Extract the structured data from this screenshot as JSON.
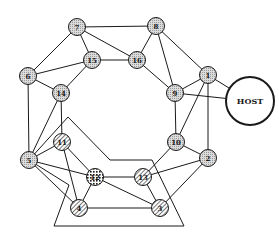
{
  "diagram": {
    "title": "",
    "host": {
      "id": "HOST",
      "label": "HOST",
      "x": 250,
      "y": 101,
      "r": 24
    },
    "nodes": [
      {
        "id": "1",
        "label": "1",
        "x": 208,
        "y": 75,
        "style": "dotted"
      },
      {
        "id": "2",
        "label": "2",
        "x": 208,
        "y": 158,
        "style": "dotted"
      },
      {
        "id": "3",
        "label": "3",
        "x": 160,
        "y": 208,
        "style": "hatched"
      },
      {
        "id": "4",
        "label": "4",
        "x": 79,
        "y": 208,
        "style": "hatched"
      },
      {
        "id": "5",
        "label": "5",
        "x": 29,
        "y": 160,
        "style": "dotted"
      },
      {
        "id": "6",
        "label": "6",
        "x": 28,
        "y": 76,
        "style": "dotted"
      },
      {
        "id": "7",
        "label": "7",
        "x": 77,
        "y": 27,
        "style": "dotted"
      },
      {
        "id": "8",
        "label": "8",
        "x": 156,
        "y": 26,
        "style": "dotted"
      },
      {
        "id": "9",
        "label": "9",
        "x": 175,
        "y": 93,
        "style": "dotted"
      },
      {
        "id": "10",
        "label": "10",
        "x": 176,
        "y": 142,
        "style": "dotted"
      },
      {
        "id": "11",
        "label": "11",
        "x": 62,
        "y": 142,
        "style": "hatched"
      },
      {
        "id": "12",
        "label": "12",
        "x": 95,
        "y": 177,
        "style": "crosshatched"
      },
      {
        "id": "13",
        "label": "13",
        "x": 143,
        "y": 177,
        "style": "hatched"
      },
      {
        "id": "14",
        "label": "14",
        "x": 61,
        "y": 93,
        "style": "dotted"
      },
      {
        "id": "15",
        "label": "15",
        "x": 92,
        "y": 60,
        "style": "dotted"
      },
      {
        "id": "16",
        "label": "16",
        "x": 137,
        "y": 60,
        "style": "dotted"
      }
    ],
    "edges": [
      [
        "7",
        "8"
      ],
      [
        "7",
        "15"
      ],
      [
        "7",
        "6"
      ],
      [
        "7",
        "16"
      ],
      [
        "8",
        "16"
      ],
      [
        "8",
        "9"
      ],
      [
        "8",
        "1"
      ],
      [
        "15",
        "6"
      ],
      [
        "15",
        "14"
      ],
      [
        "15",
        "16"
      ],
      [
        "16",
        "9"
      ],
      [
        "6",
        "14"
      ],
      [
        "6",
        "5"
      ],
      [
        "14",
        "5"
      ],
      [
        "14",
        "11"
      ],
      [
        "1",
        "9"
      ],
      [
        "1",
        "HOST"
      ],
      [
        "1",
        "10"
      ],
      [
        "1",
        "2"
      ],
      [
        "9",
        "HOST"
      ],
      [
        "9",
        "10"
      ],
      [
        "10",
        "2"
      ],
      [
        "10",
        "13"
      ],
      [
        "2",
        "13"
      ],
      [
        "2",
        "3"
      ],
      [
        "5",
        "11"
      ],
      [
        "5",
        "4"
      ],
      [
        "5",
        "12"
      ],
      [
        "11",
        "12"
      ],
      [
        "11",
        "4"
      ],
      [
        "12",
        "13"
      ],
      [
        "12",
        "4"
      ],
      [
        "12",
        "3"
      ],
      [
        "13",
        "3"
      ],
      [
        "4",
        "3"
      ]
    ],
    "region_polygon": [
      [
        68,
        117
      ],
      [
        110,
        160
      ],
      [
        152,
        160
      ],
      [
        184,
        226
      ],
      [
        54,
        226
      ],
      [
        69,
        185
      ],
      [
        29,
        160
      ]
    ],
    "colors": {
      "stroke": "#1a1a1a",
      "node_fill": "#d4d4d4",
      "background": "#ffffff"
    }
  }
}
